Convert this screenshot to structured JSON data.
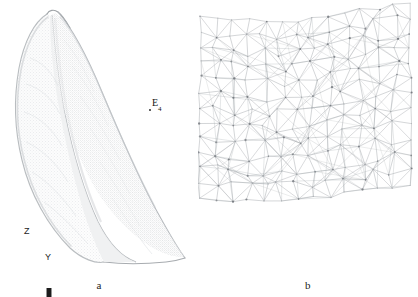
{
  "figure": {
    "kind": "scientific-figure",
    "background_color": "#ffffff",
    "panels": [
      {
        "id": "a",
        "caption": "a",
        "description": "point-cloud surface rendering of an elongated leaf-shaped specimen",
        "render_color": "#d8dadc",
        "outline_color": "#b9bcbf",
        "annotations": [
          {
            "name": "E4",
            "label_text": "E",
            "label_subscript": "4",
            "marker_x": 150,
            "marker_y": 110,
            "label_x": 153,
            "label_y": 99
          }
        ],
        "axis_indicator": {
          "name": "zy-axis-indicator",
          "vertical_label": "Z",
          "horizontal_label": "Y",
          "color": "#1c1c1c"
        }
      },
      {
        "id": "b",
        "caption": "b",
        "description": "close-up of the triangulated surface mesh",
        "mesh_line_color": "#a2a6aa",
        "mesh_node_color": "#6f7377"
      }
    ]
  }
}
